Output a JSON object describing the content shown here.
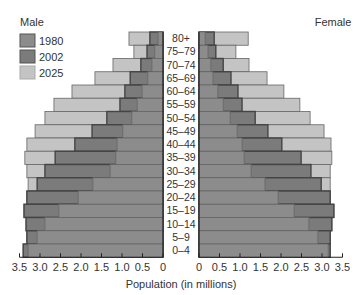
{
  "chart_data": {
    "type": "bar",
    "subtype": "population-pyramid",
    "title": "",
    "xlabel": "Population (in millions)",
    "ylabel": "",
    "left_label": "Male",
    "right_label": "Female",
    "categories": [
      "80+",
      "75–79",
      "70–74",
      "65–69",
      "60–64",
      "55–59",
      "50–54",
      "45–49",
      "40–44",
      "35–39",
      "30–34",
      "25–29",
      "20–24",
      "15–19",
      "10–14",
      "5–9",
      "0–4"
    ],
    "xlim": [
      0,
      3.5
    ],
    "x_ticks": [
      "0",
      "0.5",
      "1.0",
      "1.5",
      "2.0",
      "2.5",
      "3.0",
      "3.5"
    ],
    "left_x_ticks": [
      "3.5",
      "3.0",
      "2.5",
      "2.0",
      "1.5",
      "1.0",
      "0.5",
      "0"
    ],
    "grid": false,
    "legend_position": "top-left",
    "series": [
      {
        "name": "2025",
        "color": "#c4c4c4",
        "male": [
          0.83,
          0.71,
          1.22,
          1.66,
          2.22,
          2.66,
          2.88,
          3.12,
          3.32,
          3.37,
          3.32,
          3.29,
          3.32,
          3.39,
          3.34,
          3.32,
          3.41
        ],
        "female": [
          1.2,
          0.9,
          1.22,
          1.66,
          2.07,
          2.46,
          2.71,
          3.05,
          3.22,
          3.24,
          3.2,
          3.2,
          3.2,
          3.29,
          3.24,
          3.2,
          3.2
        ]
      },
      {
        "name": "2002",
        "color": "#7b7b7b",
        "male": [
          0.32,
          0.39,
          0.54,
          0.8,
          0.93,
          1.05,
          1.37,
          1.73,
          2.15,
          2.63,
          2.88,
          3.07,
          3.32,
          3.39,
          3.34,
          3.32,
          3.41
        ],
        "female": [
          0.37,
          0.41,
          0.59,
          0.78,
          0.95,
          1.05,
          1.37,
          1.68,
          2.02,
          2.49,
          2.73,
          2.98,
          3.2,
          3.29,
          3.24,
          3.2,
          3.2
        ]
      },
      {
        "name": "1980",
        "color": "#8c8c8c",
        "male": [
          0.12,
          0.2,
          0.27,
          0.37,
          0.51,
          0.63,
          0.76,
          0.98,
          1.12,
          1.15,
          1.29,
          1.71,
          2.07,
          2.54,
          2.88,
          3.07,
          3.29
        ],
        "female": [
          0.15,
          0.22,
          0.29,
          0.34,
          0.46,
          0.59,
          0.76,
          0.93,
          1.05,
          1.1,
          1.27,
          1.61,
          1.93,
          2.32,
          2.68,
          2.9,
          3.15
        ]
      }
    ],
    "legend": [
      {
        "label": "1980",
        "color": "#8c8c8c"
      },
      {
        "label": "2002",
        "color": "#7b7b7b"
      },
      {
        "label": "2025",
        "color": "#c4c4c4"
      }
    ]
  }
}
